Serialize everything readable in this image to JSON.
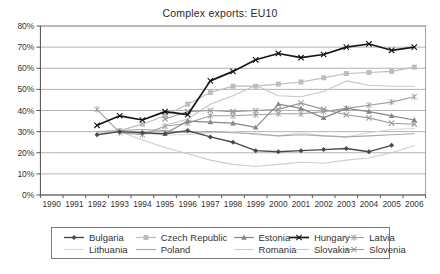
{
  "title": "Complex exports: EU10",
  "chart_data": {
    "type": "line",
    "title": "Complex exports: EU10",
    "xlabel": "",
    "ylabel": "",
    "ylim": [
      0,
      80
    ],
    "grid": true,
    "legend_position": "bottom",
    "y_ticks": [
      "0%",
      "10%",
      "20%",
      "30%",
      "40%",
      "50%",
      "60%",
      "70%",
      "80%"
    ],
    "x": [
      "1990",
      "1991",
      "1992",
      "1993",
      "1994",
      "1995",
      "1996",
      "1997",
      "1998",
      "1999",
      "2000",
      "2001",
      "2002",
      "2003",
      "2004",
      "2005",
      "2006"
    ],
    "series": [
      {
        "name": "Bulgaria",
        "color": "#474756",
        "marker": "diamond",
        "width": 1.4,
        "z": 9,
        "values": [
          null,
          null,
          28.5,
          30,
          29.5,
          29,
          30.5,
          27.5,
          25,
          21,
          20.5,
          21,
          21.5,
          22,
          20.5,
          23.5,
          null
        ]
      },
      {
        "name": "Czech Republic",
        "color": "#bdbdbd",
        "marker": "square",
        "width": 1.2,
        "z": 5,
        "values": [
          null,
          null,
          null,
          30.5,
          33.5,
          37.5,
          43,
          48.5,
          51.5,
          51.5,
          52.5,
          53.5,
          55.5,
          57.5,
          58,
          58.5,
          60.5
        ]
      },
      {
        "name": "Estonia",
        "color": "#878787",
        "marker": "triangle",
        "width": 1.2,
        "z": 8,
        "values": [
          null,
          null,
          null,
          null,
          null,
          29,
          35,
          34.5,
          34,
          32,
          43,
          41,
          36.5,
          41,
          39.5,
          37.5,
          35.5
        ]
      },
      {
        "name": "Hungary",
        "color": "#161616",
        "marker": "x",
        "width": 1.7,
        "z": 10,
        "values": [
          null,
          null,
          33,
          37.5,
          35.5,
          39.5,
          38,
          54,
          58.5,
          64,
          67,
          65,
          66.5,
          70,
          71.5,
          68.5,
          70
        ]
      },
      {
        "name": "Latvia",
        "color": "#9e9e9e",
        "marker": "asterisk",
        "width": 1.1,
        "z": 7,
        "values": [
          null,
          null,
          40.5,
          29.5,
          28.5,
          32.5,
          34,
          37.5,
          37.5,
          38,
          38.5,
          38.5,
          39.5,
          41,
          42.5,
          44,
          46.5
        ]
      },
      {
        "name": "Lithuania",
        "color": "#d8d8d8",
        "marker": "none",
        "width": 1.1,
        "z": 1,
        "values": [
          null,
          null,
          29.5,
          30,
          29,
          28.5,
          28.5,
          29.5,
          30,
          28.5,
          28,
          29.5,
          28,
          27.5,
          29.5,
          31,
          31.5
        ]
      },
      {
        "name": "Poland",
        "color": "#a9a9a9",
        "marker": "none",
        "width": 1.1,
        "z": 4,
        "values": [
          null,
          null,
          30,
          30.5,
          31,
          30.5,
          29.5,
          30,
          29.5,
          29,
          28,
          28.5,
          28,
          27.5,
          28,
          28.5,
          29
        ]
      },
      {
        "name": "Romania",
        "color": "#cccccc",
        "marker": "none",
        "width": 1.1,
        "z": 2,
        "values": [
          null,
          null,
          null,
          30,
          26,
          22.5,
          19.5,
          16.5,
          14.5,
          13.5,
          14.5,
          15.5,
          15,
          16.5,
          17.5,
          20,
          23.5
        ]
      },
      {
        "name": "Slovakia",
        "color": "#c6c6c6",
        "marker": "none",
        "width": 1.1,
        "z": 3,
        "values": [
          null,
          null,
          null,
          null,
          null,
          33,
          36,
          43,
          47,
          52,
          47,
          46.5,
          49,
          54,
          52,
          51.5,
          51.5
        ]
      },
      {
        "name": "Slovenia",
        "color": "#9b9b9b",
        "marker": "x",
        "width": 1.1,
        "z": 6,
        "values": [
          null,
          null,
          null,
          null,
          null,
          36,
          39.5,
          40,
          39.5,
          40,
          40.5,
          43.5,
          40.5,
          38,
          36.5,
          34,
          33.5
        ]
      }
    ]
  }
}
